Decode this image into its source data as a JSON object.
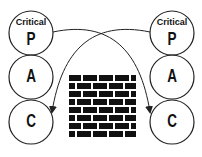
{
  "diagram": {
    "left_stack": {
      "circles": [
        {
          "letter": "P",
          "tag": "Critical"
        },
        {
          "letter": "A",
          "tag": ""
        },
        {
          "letter": "C",
          "tag": ""
        }
      ]
    },
    "right_stack": {
      "circles": [
        {
          "letter": "P",
          "tag": "Critical"
        },
        {
          "letter": "A",
          "tag": ""
        },
        {
          "letter": "C",
          "tag": ""
        }
      ]
    },
    "center_icon": "brick-wall-icon",
    "arrows": [
      {
        "from": "left P",
        "to": "right C"
      },
      {
        "from": "right P",
        "to": "left C"
      }
    ],
    "colors": {
      "stroke": "#222222",
      "brick": "#111111",
      "background": "#ffffff"
    }
  }
}
